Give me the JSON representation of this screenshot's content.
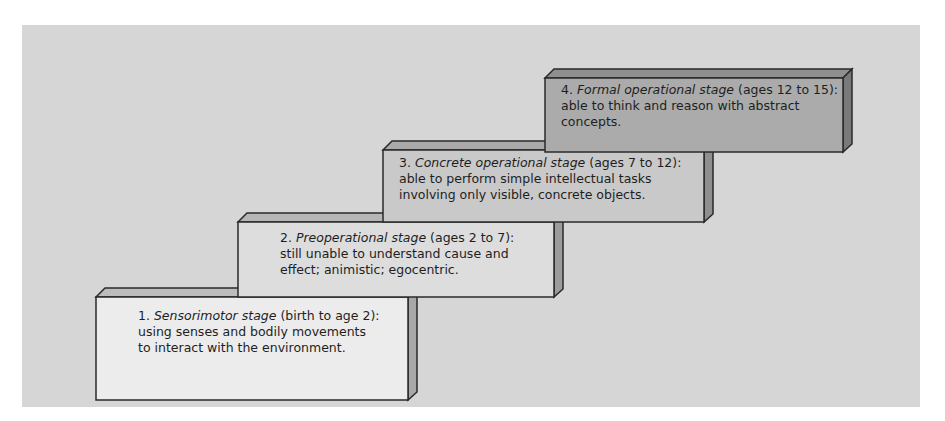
{
  "diagram": {
    "type": "staircase",
    "title": "",
    "colors": {
      "panel_bg": "#d6d6d6",
      "outline": "#2a2a2a",
      "stage_faces": [
        "#ececec",
        "#dddddd",
        "#c9c9c9",
        "#ababab"
      ],
      "stage_tops": [
        "#bcbcbc",
        "#b6b6b6",
        "#aaaaaa",
        "#8f8f8f"
      ],
      "stage_sides": [
        "#a8a8a8",
        "#9c9c9c",
        "#8f8f8f",
        "#7a7a7a"
      ]
    },
    "stages": [
      {
        "number": "1.",
        "name": "Sensorimotor stage",
        "ages": "(birth to age 2):",
        "line2": "using senses and bodily movements",
        "line3": "to interact with the environment."
      },
      {
        "number": "2.",
        "name": "Preoperational stage",
        "ages": "(ages 2 to 7):",
        "line2": "still unable to understand cause and",
        "line3": "effect; animistic; egocentric."
      },
      {
        "number": "3.",
        "name": "Concrete operational stage",
        "ages": "(ages 7 to 12):",
        "line2": "able to perform simple intellectual tasks",
        "line3": "involving only visible, concrete objects."
      },
      {
        "number": "4.",
        "name": "Formal operational stage",
        "ages": "(ages 12 to 15):",
        "line2": "able to think and reason with abstract",
        "line3": "concepts."
      }
    ]
  }
}
